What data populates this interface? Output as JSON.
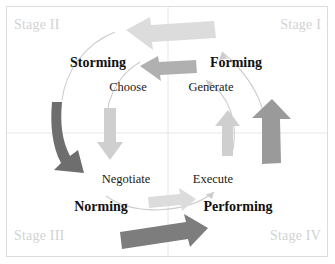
{
  "diagram": {
    "type": "quadrant-cycle",
    "background_color": "#ffffff",
    "border_color": "#dcdcdc",
    "divider_color": "#e6e6e6",
    "stage_label_color": "#d2d2d2",
    "phase_label_color": "#111111",
    "action_label_color": "#1a1a1a"
  },
  "quadrants": [
    {
      "id": "top-left",
      "stage": "Stage II",
      "phase": "Storming",
      "action": "Choose"
    },
    {
      "id": "top-right",
      "stage": "Stage I",
      "phase": "Forming",
      "action": "Generate"
    },
    {
      "id": "bottom-left",
      "stage": "Stage III",
      "phase": "Norming",
      "action": "Negotiate"
    },
    {
      "id": "bottom-right",
      "stage": "Stage IV",
      "phase": "Performing",
      "action": "Execute"
    }
  ],
  "arrows": {
    "palette": {
      "lightest": "#dcdcdc",
      "light": "#cfcfcf",
      "medium": "#b0b0b0",
      "medium_dark": "#9a9a9a",
      "dark": "#7d7d7d",
      "darkest": "#6e6e6e",
      "thin_line": "#cdcdcd"
    },
    "blocks": [
      {
        "name": "top-outer-arrow",
        "direction": "left",
        "tone": "lightest"
      },
      {
        "name": "top-inner-arrow",
        "direction": "left",
        "tone": "medium"
      },
      {
        "name": "left-outer-arrow",
        "direction": "down",
        "tone": "darkest"
      },
      {
        "name": "left-inner-arrow",
        "direction": "down",
        "tone": "light"
      },
      {
        "name": "bottom-outer-arrow",
        "direction": "right",
        "tone": "dark"
      },
      {
        "name": "bottom-inner-arrow",
        "direction": "right",
        "tone": "lightest"
      },
      {
        "name": "right-outer-arrow",
        "direction": "up",
        "tone": "medium_dark"
      },
      {
        "name": "right-inner-arrow",
        "direction": "up",
        "tone": "light"
      }
    ],
    "curves": [
      {
        "name": "outer-curve-left-down",
        "tone": "thin_line"
      },
      {
        "name": "outer-curve-right-up",
        "tone": "thin_line"
      },
      {
        "name": "inner-curve-left-down",
        "tone": "thin_line"
      },
      {
        "name": "inner-curve-right-up",
        "tone": "thin_line"
      },
      {
        "name": "inner-curve-bottom",
        "tone": "thin_line"
      }
    ]
  }
}
